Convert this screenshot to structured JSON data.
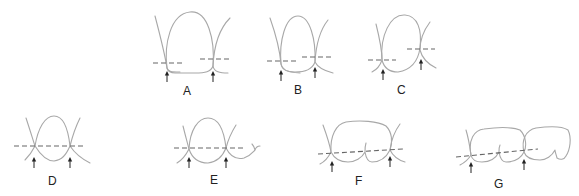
{
  "figure": {
    "panels": [
      {
        "id": "A",
        "label": "A"
      },
      {
        "id": "B",
        "label": "B"
      },
      {
        "id": "C",
        "label": "C"
      },
      {
        "id": "D",
        "label": "D"
      },
      {
        "id": "E",
        "label": "E"
      },
      {
        "id": "F",
        "label": "F"
      },
      {
        "id": "G",
        "label": "G"
      }
    ],
    "colors": {
      "outline": "#a8a8a8",
      "dashed_line": "#666666",
      "arrow": "#222222",
      "background": "#ffffff"
    }
  }
}
